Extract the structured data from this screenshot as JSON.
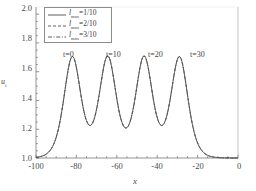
{
  "chart_data": {
    "type": "line",
    "title": "",
    "subtitle": "",
    "xlabel": "x",
    "ylabel": "u",
    "ylabel_sub": "t",
    "xlim": [
      -100,
      0
    ],
    "ylim": [
      1.0,
      2.05
    ],
    "xticks": [
      -100,
      -80,
      -60,
      -40,
      -20,
      0
    ],
    "xticklabels": [
      "-100",
      "-80",
      "-60",
      "-40",
      "-20",
      "0"
    ],
    "yticks": [
      1.0,
      1.2,
      1.4,
      1.6,
      1.8,
      2.0
    ],
    "yticklabels": [
      "1.0",
      "1.2",
      "1.4",
      "1.6",
      "1.8",
      "2.0"
    ],
    "grid": false,
    "minor_ticks": true,
    "legend_position": "upper left",
    "legend_boxed": true,
    "baseline": 1.0,
    "peak_amplitude": 1.7,
    "peak_width": 5.6,
    "annotations": [
      {
        "text": "t=0",
        "x": -82.0,
        "y": 1.78
      },
      {
        "text": "t=10",
        "x": -64.5,
        "y": 1.78
      },
      {
        "text": "t=20",
        "x": -46.5,
        "y": 1.78
      },
      {
        "text": "t=30",
        "x": -29.0,
        "y": 1.78
      }
    ],
    "series": [
      {
        "name": "l_max=1/10",
        "symbol": "l",
        "subscript": "max",
        "value": "1/10",
        "linestyle": "solid",
        "color": "#4d4d4d",
        "peaks_x": [
          -82.0,
          -64.5,
          -46.5,
          -29.0
        ],
        "peak_y": [
          1.7,
          1.7,
          1.7,
          1.7
        ]
      },
      {
        "name": "l_max=2/10",
        "symbol": "l",
        "subscript": "max",
        "value": "2/10",
        "linestyle": "dashed",
        "color": "#4d4d4d",
        "peaks_x": [
          -82.0,
          -64.5,
          -46.5,
          -29.0
        ],
        "peak_y": [
          1.7,
          1.7,
          1.7,
          1.7
        ]
      },
      {
        "name": "l_max=3/10",
        "symbol": "l",
        "subscript": "max",
        "value": "3/10",
        "linestyle": "dashdot",
        "color": "#4d4d4d",
        "peaks_x": [
          -82.0,
          -64.5,
          -46.5,
          -29.0
        ],
        "peak_y": [
          1.7,
          1.7,
          1.7,
          1.7
        ]
      }
    ]
  },
  "axes": {
    "x_label": "x",
    "y_label": "u",
    "y_label_sub": "t",
    "x_tick_labels": [
      "-100",
      "-80",
      "-60",
      "-40",
      "-20",
      "0"
    ],
    "y_tick_labels": [
      "1.0",
      "1.2",
      "1.4",
      "1.6",
      "1.8",
      "2.0"
    ]
  },
  "legend": {
    "entries": [
      {
        "style": "solid",
        "symbol": "l",
        "sub": "max",
        "rhs": "=1/10"
      },
      {
        "style": "dashed",
        "symbol": "l",
        "sub": "max",
        "rhs": "=2/10"
      },
      {
        "style": "dashdot",
        "symbol": "l",
        "sub": "max",
        "rhs": "=3/10"
      }
    ]
  },
  "peak_labels": [
    "t=0",
    "t=10",
    "t=20",
    "t=30"
  ],
  "colors": {
    "curve": "#4d4d4d",
    "axis": "#6f6f6f",
    "text": "#3a3a3a",
    "background": "#ffffff"
  }
}
